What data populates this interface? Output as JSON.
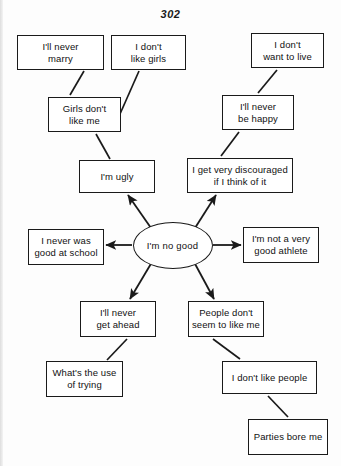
{
  "page": {
    "number": "302",
    "width": 341,
    "height": 466,
    "background": "#fdfdfd",
    "ink": "#1a1a1a"
  },
  "diagram": {
    "type": "radial-flow",
    "core": {
      "id": "core",
      "label": "I'm no good",
      "shape": "ellipse",
      "cx": 172.5,
      "cy": 245,
      "rx": 40,
      "ry": 23.5
    },
    "nodes": [
      {
        "id": "ill-never-marry",
        "lines": [
          "I'll never",
          "marry"
        ],
        "x": 17,
        "y": 35,
        "w": 87,
        "h": 35
      },
      {
        "id": "i-dont-like-girls",
        "lines": [
          "I don't",
          "like girls"
        ],
        "x": 111,
        "y": 35,
        "w": 75,
        "h": 35
      },
      {
        "id": "i-dont-want-to-live",
        "lines": [
          "I don't",
          "want to live"
        ],
        "x": 251,
        "y": 33,
        "w": 73,
        "h": 35
      },
      {
        "id": "girls-dont-like-me",
        "lines": [
          "Girls don't",
          "like me"
        ],
        "x": 48,
        "y": 97,
        "w": 73,
        "h": 35
      },
      {
        "id": "ill-never-be-happy",
        "lines": [
          "I'll never",
          "be happy"
        ],
        "x": 222,
        "y": 95,
        "w": 72,
        "h": 35
      },
      {
        "id": "im-ugly",
        "lines": [
          "I'm ugly"
        ],
        "x": 79,
        "y": 160,
        "w": 76,
        "h": 33
      },
      {
        "id": "i-get-very-discouraged",
        "lines": [
          "I get very discouraged",
          "if I think of it"
        ],
        "x": 187,
        "y": 158,
        "w": 106,
        "h": 35
      },
      {
        "id": "i-never-was-good-at-school",
        "lines": [
          "I never was",
          "good at school"
        ],
        "x": 28,
        "y": 229,
        "w": 76,
        "h": 36
      },
      {
        "id": "im-not-a-very-good-athlete",
        "lines": [
          "I'm not a very",
          "good athlete"
        ],
        "x": 243,
        "y": 227,
        "w": 76,
        "h": 36
      },
      {
        "id": "ill-never-get-ahead",
        "lines": [
          "I'll never",
          "get ahead"
        ],
        "x": 80,
        "y": 301,
        "w": 76,
        "h": 36
      },
      {
        "id": "people-dont-seem-to-like-me",
        "lines": [
          "People don't",
          "seem to like me"
        ],
        "x": 188,
        "y": 301,
        "w": 76,
        "h": 36
      },
      {
        "id": "whats-the-use-of-trying",
        "lines": [
          "What's the use",
          "of trying"
        ],
        "x": 46,
        "y": 361,
        "w": 77,
        "h": 36
      },
      {
        "id": "i-dont-like-people",
        "lines": [
          "I don't like people"
        ],
        "x": 222,
        "y": 361,
        "w": 95,
        "h": 33
      },
      {
        "id": "parties-bore-me",
        "lines": [
          "Parties bore me"
        ],
        "x": 248,
        "y": 419,
        "w": 80,
        "h": 36
      }
    ],
    "edges": [
      {
        "from": "core",
        "to": "im-ugly",
        "arrow": true,
        "x1": 151,
        "y1": 228,
        "x2": 128,
        "y2": 195
      },
      {
        "from": "core",
        "to": "i-get-very-discouraged",
        "arrow": true,
        "x1": 195,
        "y1": 228,
        "x2": 216,
        "y2": 195
      },
      {
        "from": "core",
        "to": "i-never-was-good-at-school",
        "arrow": true,
        "x1": 132,
        "y1": 245,
        "x2": 106,
        "y2": 245
      },
      {
        "from": "core",
        "to": "im-not-a-very-good-athlete",
        "arrow": true,
        "x1": 213,
        "y1": 245,
        "x2": 241,
        "y2": 245
      },
      {
        "from": "core",
        "to": "ill-never-get-ahead",
        "arrow": true,
        "x1": 152,
        "y1": 262,
        "x2": 130,
        "y2": 299
      },
      {
        "from": "core",
        "to": "people-dont-seem-to-like-me",
        "arrow": true,
        "x1": 194,
        "y1": 262,
        "x2": 214,
        "y2": 299
      },
      {
        "from": "im-ugly",
        "to": "girls-dont-like-me",
        "arrow": false,
        "x1": 110,
        "y1": 159,
        "x2": 96,
        "y2": 134
      },
      {
        "from": "girls-dont-like-me",
        "to": "ill-never-marry",
        "arrow": false,
        "x1": 70,
        "y1": 95,
        "x2": 84,
        "y2": 71
      },
      {
        "from": "girls-dont-like-me",
        "to": "i-dont-like-girls",
        "arrow": false,
        "x1": 120,
        "y1": 114,
        "x2": 139,
        "y2": 71
      },
      {
        "from": "i-get-very-discouraged",
        "to": "ill-never-be-happy",
        "arrow": false,
        "x1": 221,
        "y1": 156,
        "x2": 239,
        "y2": 132
      },
      {
        "from": "ill-never-be-happy",
        "to": "i-dont-want-to-live",
        "arrow": false,
        "x1": 258,
        "y1": 93,
        "x2": 277,
        "y2": 70
      },
      {
        "from": "ill-never-get-ahead",
        "to": "whats-the-use-of-trying",
        "arrow": false,
        "x1": 127,
        "y1": 339,
        "x2": 107,
        "y2": 360
      },
      {
        "from": "people-dont-seem-to-like-me",
        "to": "i-dont-like-people",
        "arrow": false,
        "x1": 213,
        "y1": 339,
        "x2": 240,
        "y2": 359
      },
      {
        "from": "i-dont-like-people",
        "to": "parties-bore-me",
        "arrow": false,
        "x1": 268,
        "y1": 396,
        "x2": 288,
        "y2": 417
      }
    ]
  }
}
